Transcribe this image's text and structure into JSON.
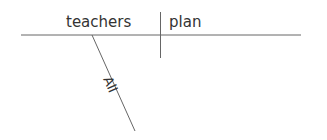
{
  "diagram": {
    "type": "sentence-diagram",
    "subject": "teachers",
    "verb": "plan",
    "modifiers": [
      {
        "word": "All",
        "modifies": "teachers"
      }
    ],
    "colors": {
      "line": "#555555",
      "text": "#333333"
    }
  }
}
